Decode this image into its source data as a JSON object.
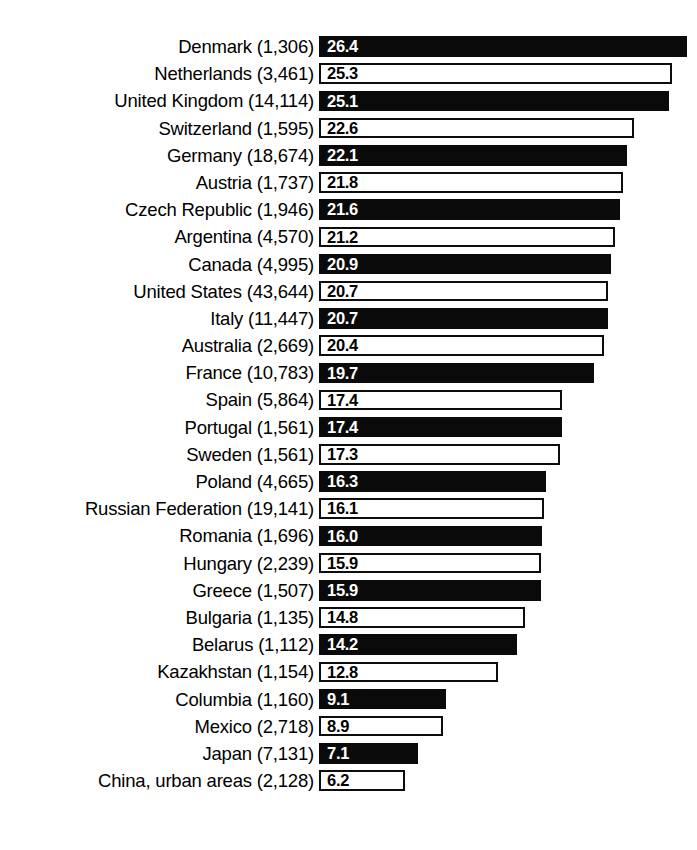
{
  "chart_data": {
    "type": "bar",
    "orientation": "horizontal",
    "title": "",
    "subtitle": "",
    "xlabel": "",
    "ylabel": "",
    "grid": false,
    "legend": null,
    "xlim": [
      0,
      26.4
    ],
    "value_label_precision": 1,
    "categories": [
      "Denmark (1,306)",
      "Netherlands (3,461)",
      "United Kingdom (14,114)",
      "Switzerland (1,595)",
      "Germany (18,674)",
      "Austria (1,737)",
      "Czech Republic (1,946)",
      "Argentina (4,570)",
      "Canada (4,995)",
      "United States (43,644)",
      "Italy (11,447)",
      "Australia (2,669)",
      "France (10,783)",
      "Spain (5,864)",
      "Portugal (1,561)",
      "Sweden (1,561)",
      "Poland (4,665)",
      "Russian Federation (19,141)",
      "Romania (1,696)",
      "Hungary (2,239)",
      "Greece (1,507)",
      "Bulgaria (1,135)",
      "Belarus (1,112)",
      "Kazakhstan (1,154)",
      "Columbia (1,160)",
      "Mexico (2,718)",
      "Japan (7,131)",
      "China, urban areas (2,128)"
    ],
    "values": [
      26.4,
      25.3,
      25.1,
      22.6,
      22.1,
      21.8,
      21.6,
      21.2,
      20.9,
      20.7,
      20.7,
      20.4,
      19.7,
      17.4,
      17.4,
      17.3,
      16.3,
      16.1,
      16.0,
      15.9,
      15.9,
      14.8,
      14.2,
      12.8,
      9.1,
      8.9,
      7.1,
      6.2
    ],
    "value_labels": [
      "26.4",
      "25.3",
      "25.1",
      "22.6",
      "22.1",
      "21.8",
      "21.6",
      "21.2",
      "20.9",
      "20.7",
      "20.7",
      "20.4",
      "19.7",
      "17.4",
      "17.4",
      "17.3",
      "16.3",
      "16.1",
      "16.0",
      "15.9",
      "15.9",
      "14.8",
      "14.2",
      "12.8",
      "9.1",
      "8.9",
      "7.1",
      "6.2"
    ],
    "bar_styles": [
      "filled",
      "open",
      "filled",
      "open",
      "filled",
      "open",
      "filled",
      "open",
      "filled",
      "open",
      "filled",
      "open",
      "filled",
      "open",
      "filled",
      "open",
      "filled",
      "open",
      "filled",
      "open",
      "filled",
      "open",
      "filled",
      "open",
      "filled",
      "open",
      "filled",
      "open"
    ],
    "colors": {
      "filled_bar": "#0a0a0a",
      "open_bar_fill": "#ffffff",
      "open_bar_border": "#0d0d0d",
      "label_text": "#000000",
      "value_on_filled": "#ffffff",
      "value_on_open": "#000000",
      "background": "#ffffff"
    },
    "px_per_unit": 13.95,
    "bar_origin_x": 319
  }
}
